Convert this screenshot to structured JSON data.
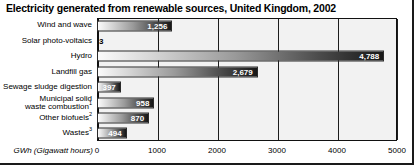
{
  "chart_data": {
    "type": "bar",
    "orientation": "horizontal",
    "title": "Electricity generated from renewable sources, United Kingdom, 2002",
    "xlabel": "GWh (Gigawatt hours)",
    "ylabel": "",
    "xlim": [
      0,
      5000
    ],
    "xticks": [
      0,
      1000,
      2000,
      3000,
      4000,
      5000
    ],
    "xtick_labels": [
      "0",
      "1000",
      "2000",
      "3000",
      "4000",
      "5000"
    ],
    "grid": "vertical",
    "legend": "none",
    "categories": [
      "Wind and wave",
      "Solar photo-voltaics",
      "Hydro",
      "Landfill gas",
      "Sewage sludge digestion",
      "Municipal solid waste combustion",
      "Other biofuels",
      "Wastes"
    ],
    "values": [
      1256,
      3,
      4788,
      2679,
      397,
      958,
      870,
      494
    ],
    "value_labels": [
      "1,256",
      "3",
      "4,788",
      "2,679",
      "397",
      "958",
      "870",
      "494"
    ],
    "footnote_markers": [
      "",
      "",
      "",
      "",
      "",
      "1",
      "2",
      "3"
    ],
    "bars": [
      {
        "label": "Wind and wave",
        "label_line1": "Wind and wave",
        "label_line2": "",
        "marker": "",
        "value": 1256,
        "value_label": "1,256",
        "inside": true
      },
      {
        "label": "Solar photo-voltaics",
        "label_line1": "Solar photo-voltaics",
        "label_line2": "",
        "marker": "",
        "value": 3,
        "value_label": "3",
        "inside": false
      },
      {
        "label": "Hydro",
        "label_line1": "Hydro",
        "label_line2": "",
        "marker": "",
        "value": 4788,
        "value_label": "4,788",
        "inside": true
      },
      {
        "label": "Landfill gas",
        "label_line1": "Landfill gas",
        "label_line2": "",
        "marker": "",
        "value": 2679,
        "value_label": "2,679",
        "inside": true
      },
      {
        "label": "Sewage sludge digestion",
        "label_line1": "Sewage sludge digestion",
        "label_line2": "",
        "marker": "",
        "value": 397,
        "value_label": "397",
        "inside": true
      },
      {
        "label": "Municipal solid waste combustion",
        "label_line1": "Municipal solid",
        "label_line2": "waste combustion",
        "marker": "1",
        "value": 958,
        "value_label": "958",
        "inside": true
      },
      {
        "label": "Other biofuels",
        "label_line1": "Other biofuels",
        "label_line2": "",
        "marker": "2",
        "value": 870,
        "value_label": "870",
        "inside": true
      },
      {
        "label": "Wastes",
        "label_line1": "Wastes",
        "label_line2": "",
        "marker": "3",
        "value": 494,
        "value_label": "494",
        "inside": true
      }
    ]
  },
  "colors": {
    "bar_start": "#fbfbfb",
    "bar_end": "#171717",
    "plot_background": "#f2f2f2",
    "gridline": "#1d1d1d",
    "text": "#000000",
    "value_text_inside": "#ffffff"
  }
}
